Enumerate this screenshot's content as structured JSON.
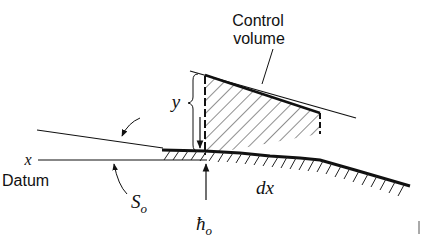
{
  "diagram": {
    "labels": {
      "control_volume_line1": "Control",
      "control_volume_line2": "volume",
      "depth": "y",
      "x_axis": "x",
      "datum": "Datum",
      "slope": "S",
      "slope_sub": "o",
      "dx": "dx",
      "h0": "ħ",
      "h0_sub": "o"
    },
    "colors": {
      "ink": "#111111",
      "background": "#ffffff"
    }
  }
}
